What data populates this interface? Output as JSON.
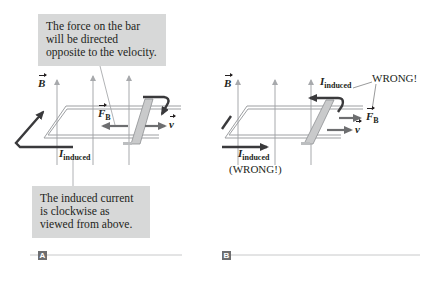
{
  "colors": {
    "callout_bg": "#d7d8d8",
    "field_arrow": "#a7a9ac",
    "rail": "#9d9fa2",
    "current_arrow": "#3a3a3c",
    "force_arrow": "#6d6e70",
    "panel_tag_bg": "#6d6e70",
    "divider": "#c8c9ca"
  },
  "panel_a": {
    "tag": "A",
    "callout_top": "The force on the bar will be directed opposite to the velocity.",
    "callout_bottom": "The induced current is clockwise as viewed from above.",
    "labels": {
      "b_field": "B",
      "force": "F",
      "force_sub": "B",
      "velocity": "v",
      "current": "I",
      "current_sub": "induced"
    }
  },
  "panel_b": {
    "tag": "B",
    "labels": {
      "b_field": "B",
      "force": "F",
      "force_sub": "B",
      "velocity": "v",
      "current_top": "I",
      "current_top_sub": "induced",
      "wrong_top": "WRONG!",
      "current_bottom": "I",
      "current_bottom_sub": "induced",
      "wrong_bottom": "(WRONG!)"
    }
  }
}
